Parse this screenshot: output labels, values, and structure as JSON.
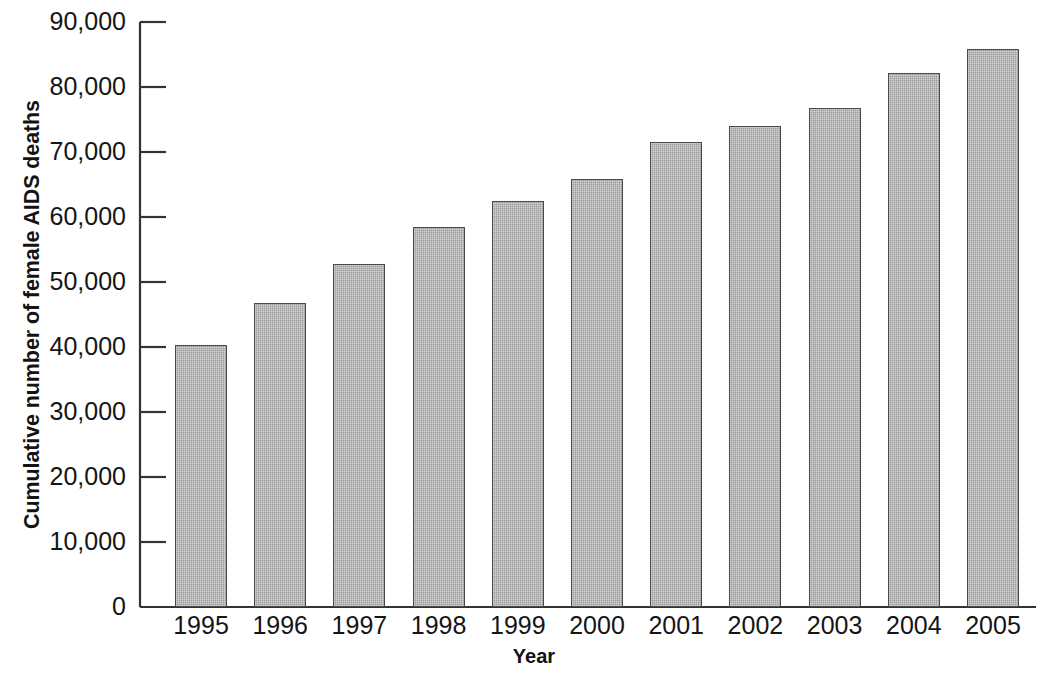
{
  "chart_data": {
    "type": "bar",
    "title": "",
    "subtitle": "",
    "xlabel": "Year",
    "ylabel": "Cumulative number of female AIDS deaths",
    "categories": [
      "1995",
      "1996",
      "1997",
      "1998",
      "1999",
      "2000",
      "2001",
      "2002",
      "2003",
      "2004",
      "2005"
    ],
    "values": [
      40300,
      46800,
      52800,
      58500,
      62400,
      65900,
      71500,
      74000,
      76800,
      82100,
      85900
    ],
    "ylim": [
      0,
      90000
    ],
    "ytick_values": [
      0,
      10000,
      20000,
      30000,
      40000,
      50000,
      60000,
      70000,
      80000,
      90000
    ],
    "ytick_labels": [
      "0",
      "10,000",
      "20,000",
      "30,000",
      "40,000",
      "50,000",
      "60,000",
      "70,000",
      "80,000",
      "90,000"
    ],
    "grid": false,
    "legend": false,
    "legend_position": "none",
    "series": [
      {
        "name": "Cumulative female AIDS deaths",
        "values": [
          40300,
          46800,
          52800,
          58500,
          62400,
          65900,
          71500,
          74000,
          76800,
          82100,
          85900
        ]
      }
    ],
    "bar_fill_color": "#9c9c9c",
    "bar_edge_color": "#4a4a4a",
    "axis_color": "#333333",
    "text_color": "#151515"
  }
}
